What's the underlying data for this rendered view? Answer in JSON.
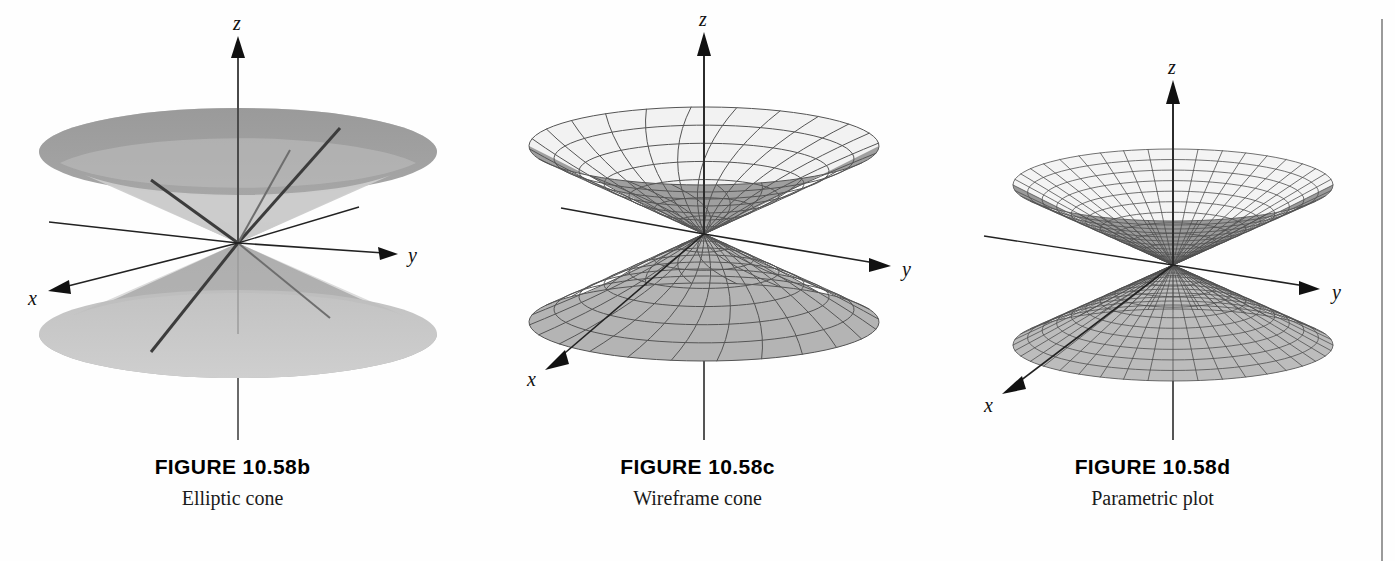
{
  "page": {
    "background": "#ffffff",
    "right_rule_color": "#9a9a9a"
  },
  "figures": [
    {
      "id": "fig-10-58b",
      "title": "FIGURE 10.58b",
      "subtitle": "Elliptic cone",
      "kind": "shaded-elliptic-cone",
      "axes": {
        "x": "x",
        "y": "y",
        "z": "z"
      },
      "colors": {
        "rim_dark": "#9b9b9b",
        "body_mid": "#a8a8a8",
        "body_light": "#c6c6c6",
        "body_lighter": "#d2d2d2",
        "ruling": "#3a3a3a",
        "axis": "#4a4a4a"
      }
    },
    {
      "id": "fig-10-58c",
      "title": "FIGURE 10.58c",
      "subtitle": "Wireframe cone",
      "kind": "wireframe-quad-mesh-cone",
      "axes": {
        "x": "x",
        "y": "y",
        "z": "z"
      },
      "colors": {
        "mesh": "#555555",
        "upper_fill": "#f2f2f2",
        "lower_fill": "#b4b4b4",
        "inner_shade": "#9f9f9f",
        "axis": "#2b2b2b"
      },
      "mesh": {
        "radial_lines": 24,
        "ring_lines": 7
      }
    },
    {
      "id": "fig-10-58d",
      "title": "FIGURE 10.58d",
      "subtitle": "Parametric plot",
      "kind": "parametric-polar-mesh-cone",
      "axes": {
        "x": "x",
        "y": "y",
        "z": "z"
      },
      "colors": {
        "mesh": "#4f4f4f",
        "upper_fill": "#f4f4f4",
        "lower_fill": "#bcbcbc",
        "inner_shade": "#9a9a9a",
        "axis": "#2b2b2b"
      },
      "mesh": {
        "radial_lines": 40,
        "ring_lines": 11
      }
    }
  ],
  "chart_data": {
    "type": "scatter",
    "xlabel": "x",
    "ylabel": "y",
    "zlabel": "z",
    "panels": [
      {
        "label": "FIGURE 10.58b",
        "caption": "Elliptic cone",
        "render": "shaded surface with ruling lines"
      },
      {
        "label": "FIGURE 10.58c",
        "caption": "Wireframe cone",
        "render": "rectangular wireframe mesh"
      },
      {
        "label": "FIGURE 10.58d",
        "caption": "Parametric plot",
        "render": "polar parametric mesh"
      }
    ]
  }
}
